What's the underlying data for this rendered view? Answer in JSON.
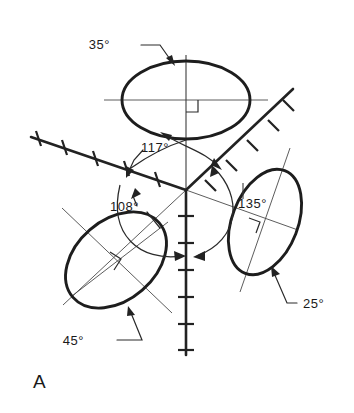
{
  "figure": {
    "label": "A",
    "background_color": "#ffffff",
    "line_color": "#222222",
    "thin_line_color": "#4a4a4a"
  },
  "annotations": {
    "top_ellipse_angle": "35°",
    "upper_left_axis_angle": "117°",
    "lower_left_ellipse_sector_angle": "108°",
    "right_ellipse_angle": "135°",
    "right_ellipse_tilt": "25°",
    "lower_left_ellipse_tilt": "45°"
  },
  "elements": {
    "top_ellipse_name": "top-ellipse",
    "lower_left_ellipse_name": "lower-left-ellipse",
    "right_ellipse_name": "right-ellipse",
    "vertical_axis_name": "vertical-axis",
    "upper_left_axis_name": "upper-left-axis",
    "upper_right_axis_name": "upper-right-axis"
  }
}
